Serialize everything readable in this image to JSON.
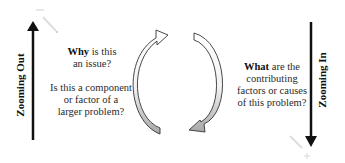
{
  "left": {
    "axis_label": "Zooming Out",
    "question1_bold": "Why",
    "question1_rest_line1": " is this",
    "question1_line2": "an issue?",
    "question2_line1": "Is this a component",
    "question2_line2": "or factor of a",
    "question2_line3": "larger problem?"
  },
  "right": {
    "axis_label": "Zooming In",
    "question_bold": "What",
    "question_rest_line1": " are the",
    "question_line2": "contributing",
    "question_line3": "factors or causes",
    "question_line4": "of this problem?"
  },
  "colors": {
    "arrow_dark": "#111111",
    "cycle_fill_top": "#ffffff",
    "cycle_fill_bottom": "#a8a8a8",
    "magnifier": "#c8c8c8"
  }
}
